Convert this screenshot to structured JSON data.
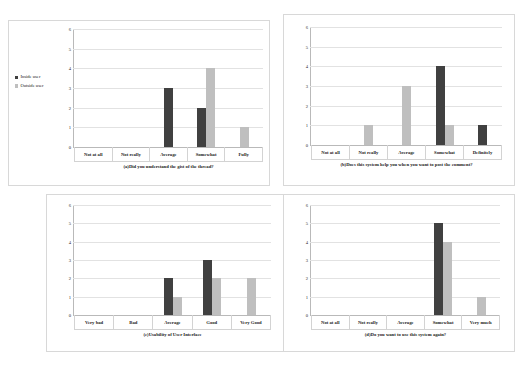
{
  "figure": {
    "legend": {
      "inside_label": "Inside user",
      "outside_label": "Outside user",
      "inside_color": "#404040",
      "outside_color": "#bfbfbf"
    },
    "y_ticks": [
      "0",
      "1",
      "2",
      "3",
      "4",
      "5",
      "6"
    ]
  },
  "chart_data": [
    {
      "id": "a",
      "type": "bar",
      "title": "(a)Did you understand the gist of the thread?",
      "xlabel": "",
      "ylabel": "",
      "ylim": [
        0,
        6
      ],
      "grid": true,
      "legend_position": "left-outside",
      "categories": [
        "Not at all",
        "Not really",
        "Average",
        "Somewhat",
        "Fully"
      ],
      "series": [
        {
          "name": "Inside user",
          "values": [
            0,
            0,
            3,
            2,
            0
          ]
        },
        {
          "name": "Outside user",
          "values": [
            0,
            0,
            0,
            4,
            1
          ]
        }
      ]
    },
    {
      "id": "b",
      "type": "bar",
      "title": "(b)Does this system help you when you want to post the comment?",
      "xlabel": "",
      "ylabel": "",
      "ylim": [
        0,
        6
      ],
      "grid": true,
      "legend_position": "none",
      "categories": [
        "Not at all",
        "Not really",
        "Average",
        "Somewhat",
        "Definitely"
      ],
      "series": [
        {
          "name": "Inside user",
          "values": [
            0,
            0,
            0,
            4,
            1
          ]
        },
        {
          "name": "Outside user",
          "values": [
            0,
            1,
            3,
            1,
            0
          ]
        }
      ]
    },
    {
      "id": "c",
      "type": "bar",
      "title": "(c)Usability of User Interface",
      "xlabel": "",
      "ylabel": "",
      "ylim": [
        0,
        6
      ],
      "grid": true,
      "legend_position": "none",
      "categories": [
        "Very bad",
        "Bad",
        "Average",
        "Good",
        "Very Good"
      ],
      "series": [
        {
          "name": "Inside user",
          "values": [
            0,
            0,
            2,
            3,
            0
          ]
        },
        {
          "name": "Outside user",
          "values": [
            0,
            0,
            1,
            2,
            2
          ]
        }
      ]
    },
    {
      "id": "d",
      "type": "bar",
      "title": "(d)Do you want to use this system again?",
      "xlabel": "",
      "ylabel": "",
      "ylim": [
        0,
        6
      ],
      "grid": true,
      "legend_position": "none",
      "categories": [
        "Not at all",
        "Not really",
        "Average",
        "Somewhat",
        "Very much"
      ],
      "series": [
        {
          "name": "Inside user",
          "values": [
            0,
            0,
            0,
            5,
            0
          ]
        },
        {
          "name": "Outside user",
          "values": [
            0,
            0,
            0,
            4,
            1
          ]
        }
      ]
    }
  ]
}
